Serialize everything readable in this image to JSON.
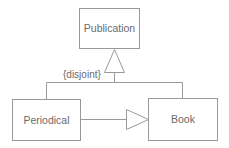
{
  "diagram": {
    "type": "uml-class-diagram",
    "classes": [
      {
        "id": "publication",
        "label": "Publication"
      },
      {
        "id": "periodical",
        "label": "Periodical"
      },
      {
        "id": "book",
        "label": "Book"
      }
    ],
    "generalization": {
      "parent": "Publication",
      "children": [
        "Periodical",
        "Book"
      ],
      "constraint": "{disjoint}"
    },
    "extra_generalization": {
      "from": "Periodical",
      "to": "Book"
    }
  },
  "colors": {
    "stroke": "#9a9a9a",
    "text": "#6a6a6a",
    "background": "#ffffff"
  }
}
